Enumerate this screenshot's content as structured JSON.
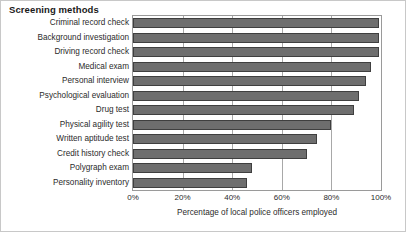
{
  "chart_data": {
    "type": "bar",
    "orientation": "horizontal",
    "title": "Screening methods",
    "xlabel": "Percentage of local police officers employed",
    "ylabel": "",
    "xlim": [
      0,
      100
    ],
    "xticks": [
      "0%",
      "20%",
      "40%",
      "60%",
      "80%",
      "100%"
    ],
    "xtick_values": [
      0,
      20,
      40,
      60,
      80,
      100
    ],
    "grid": true,
    "legend": null,
    "bar_color": "#6e6e6e",
    "bar_edge_color": "#3f3f3f",
    "categories": [
      "Criminal record check",
      "Background investigation",
      "Driving record check",
      "Medical exam",
      "Personal interview",
      "Psychological evaluation",
      "Drug test",
      "Physical agility test",
      "Written aptitude test",
      "Credit history check",
      "Polygraph exam",
      "Personality inventory"
    ],
    "values": [
      99,
      99,
      99,
      96,
      94,
      91,
      89,
      80,
      74,
      70,
      48,
      46
    ]
  }
}
